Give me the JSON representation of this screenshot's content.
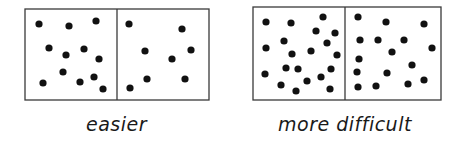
{
  "colors": {
    "background": "#ffffff",
    "line": "#3a3a3a",
    "dot": "#111111"
  },
  "figure": {
    "groups": [
      {
        "label": "easier",
        "box": {
          "x": 25,
          "y": 9,
          "width": 184,
          "height": 91,
          "divider_x": 117
        },
        "panels": [
          {
            "dot_count": 12,
            "dots": [
              [
                39,
                24
              ],
              [
                69,
                26
              ],
              [
                96,
                21
              ],
              [
                49,
                48
              ],
              [
                66,
                55
              ],
              [
                84,
                49
              ],
              [
                99,
                59
              ],
              [
                63,
                72
              ],
              [
                80,
                82
              ],
              [
                94,
                77
              ],
              [
                43,
                83
              ],
              [
                103,
                89
              ]
            ]
          },
          {
            "dot_count": 8,
            "dots": [
              [
                129,
                24
              ],
              [
                182,
                29
              ],
              [
                145,
                51
              ],
              [
                172,
                59
              ],
              [
                191,
                50
              ],
              [
                147,
                79
              ],
              [
                185,
                79
              ],
              [
                130,
                88
              ]
            ]
          }
        ]
      },
      {
        "label": "more difficult",
        "box": {
          "x": 253,
          "y": 7,
          "width": 188,
          "height": 93,
          "divider_x": 345
        },
        "panels": [
          {
            "dot_count": 20,
            "dots": [
              [
                266,
                22
              ],
              [
                291,
                23
              ],
              [
                323,
                17
              ],
              [
                316,
                31
              ],
              [
                335,
                33
              ],
              [
                284,
                41
              ],
              [
                327,
                43
              ],
              [
                266,
                48
              ],
              [
                292,
                54
              ],
              [
                311,
                51
              ],
              [
                337,
                55
              ],
              [
                265,
                74
              ],
              [
                286,
                68
              ],
              [
                298,
                69
              ],
              [
                331,
                69
              ],
              [
                281,
                85
              ],
              [
                296,
                91
              ],
              [
                307,
                81
              ],
              [
                321,
                77
              ],
              [
                330,
                89
              ]
            ]
          },
          {
            "dot_count": 16,
            "dots": [
              [
                358,
                17
              ],
              [
                386,
                22
              ],
              [
                424,
                24
              ],
              [
                360,
                40
              ],
              [
                378,
                40
              ],
              [
                404,
                40
              ],
              [
                432,
                48
              ],
              [
                392,
                52
              ],
              [
                359,
                59
              ],
              [
                412,
                65
              ],
              [
                357,
                72
              ],
              [
                387,
                73
              ],
              [
                358,
                87
              ],
              [
                376,
                86
              ],
              [
                408,
                84
              ],
              [
                424,
                80
              ]
            ]
          }
        ]
      }
    ]
  }
}
